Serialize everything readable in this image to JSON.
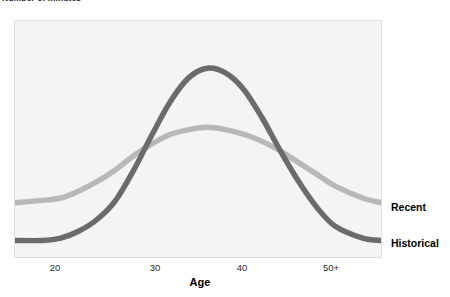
{
  "chart_data": {
    "type": "line",
    "title": "Number of minutes",
    "xlabel": "Age",
    "ylabel": "Number of minutes",
    "grid": false,
    "legend_position": "right-inline",
    "xticks": [
      "20",
      "30",
      "40",
      "50+"
    ],
    "xtick_positions": [
      20,
      30,
      40,
      50
    ],
    "xlim": [
      15,
      55
    ],
    "ylim": [
      0,
      100
    ],
    "yticks": [],
    "annotations": [],
    "series": [
      {
        "name": "Historical",
        "color": "#6b6b6b",
        "description": "tall narrow bell curve peaking near age 36",
        "x": [
          15,
          18,
          20,
          22,
          24,
          26,
          28,
          30,
          32,
          34,
          36,
          38,
          40,
          42,
          44,
          46,
          48,
          50,
          53,
          55
        ],
        "values": [
          7,
          7,
          8,
          11,
          16,
          24,
          37,
          52,
          66,
          76,
          80,
          78,
          71,
          59,
          45,
          32,
          21,
          13,
          8,
          7
        ]
      },
      {
        "name": "Recent",
        "color": "#b8b8b8",
        "description": "shorter flatter bell curve peaking near age 35",
        "x": [
          15,
          18,
          20,
          22,
          24,
          26,
          28,
          30,
          32,
          34,
          36,
          38,
          40,
          42,
          44,
          46,
          48,
          50,
          53,
          55
        ],
        "values": [
          23,
          24,
          25,
          28,
          32,
          37,
          43,
          48,
          52,
          54,
          55,
          54,
          52,
          49,
          45,
          40,
          35,
          30,
          25,
          23
        ]
      }
    ]
  },
  "legend": {
    "recent_label": "Recent",
    "historical_label": "Historical"
  },
  "axis": {
    "x_title": "Age",
    "y_title": "Number of minutes",
    "tick_20": "20",
    "tick_30": "30",
    "tick_40": "40",
    "tick_50": "50+"
  }
}
